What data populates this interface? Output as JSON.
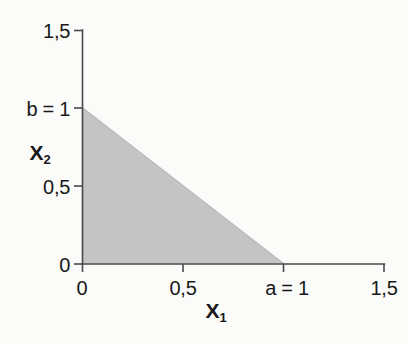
{
  "chart_data": {
    "type": "area",
    "title": "",
    "subtitle": "",
    "xlabel": "X₁",
    "ylabel": "X₂",
    "xlim": [
      0,
      1.5
    ],
    "ylim": [
      0,
      1.5
    ],
    "grid": false,
    "legend": null,
    "x_tick_values": [
      0,
      0.5,
      1,
      1.5
    ],
    "x_tick_labels": [
      "0",
      "0,5",
      "a = 1",
      "1,5"
    ],
    "y_tick_values": [
      0,
      0.5,
      1,
      1.5
    ],
    "y_tick_labels": [
      "0",
      "0,5",
      "b = 1",
      "1,5"
    ],
    "decimal_separator": ",",
    "region": {
      "name": "feasible-region",
      "description": "shaded triangle bounded by the axes and the line x1/a + x2/b = 1",
      "vertices": [
        [
          0,
          0
        ],
        [
          0,
          1
        ],
        [
          1,
          0
        ]
      ],
      "fill_color": "#c6c6c6",
      "boundary_line": {
        "from": [
          0,
          1
        ],
        "to": [
          1,
          0
        ],
        "intercept_x": 1,
        "intercept_y": 1
      }
    },
    "parameters": [
      {
        "symbol": "a",
        "value": 1,
        "label": "a = 1",
        "axis": "x"
      },
      {
        "symbol": "b",
        "value": 1,
        "label": "b = 1",
        "axis": "y"
      }
    ]
  },
  "axes": {
    "x_title": "X",
    "x_title_sub": "1",
    "y_title": "X",
    "y_title_sub": "2",
    "x_ticks": [
      {
        "label": "0"
      },
      {
        "label": "0,5"
      },
      {
        "label": "a = 1"
      },
      {
        "label": "1,5"
      }
    ],
    "y_ticks": [
      {
        "label": "0"
      },
      {
        "label": "0,5"
      },
      {
        "label": "b = 1"
      },
      {
        "label": "1,5"
      }
    ]
  },
  "colors": {
    "axis": "#4a4a4a",
    "text": "#181818",
    "region_fill": "#c6c6c6",
    "background": "#fdfdfc"
  }
}
